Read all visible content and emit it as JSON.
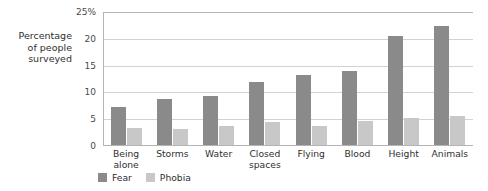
{
  "chart_data": {
    "type": "bar",
    "title": "",
    "subtitle": "",
    "xlabel": "",
    "ylabel": "Percentage\nof people\nsurveyed",
    "ylim": [
      0,
      25
    ],
    "yticks": [
      0,
      5,
      10,
      15,
      20,
      25
    ],
    "ytick_labels": [
      "0",
      "5",
      "10",
      "15",
      "20",
      "25%"
    ],
    "grid": true,
    "legend_position": "bottom-left",
    "orientation": "vertical",
    "grouping": "grouped",
    "categories": [
      "Being\nalone",
      "Storms",
      "Water",
      "Closed\nspaces",
      "Flying",
      "Blood",
      "Height",
      "Animals"
    ],
    "series": [
      {
        "name": "Fear",
        "color": "#8a8a8a",
        "values": [
          7.0,
          8.6,
          9.2,
          11.8,
          13.0,
          13.8,
          20.3,
          22.2
        ]
      },
      {
        "name": "Phobia",
        "color": "#c8c8c8",
        "values": [
          3.2,
          3.0,
          3.5,
          4.3,
          3.5,
          4.4,
          5.1,
          5.5
        ]
      }
    ]
  },
  "legend": {
    "items": [
      {
        "label": "Fear",
        "color": "#8a8a8a"
      },
      {
        "label": "Phobia",
        "color": "#c8c8c8"
      }
    ]
  },
  "colors": {
    "fear": "#8a8a8a",
    "phobia": "#c8c8c8",
    "gridline": "#d2d2d2",
    "axis": "#b4b4b4",
    "text": "#2f2f2f",
    "background": "#ffffff"
  }
}
